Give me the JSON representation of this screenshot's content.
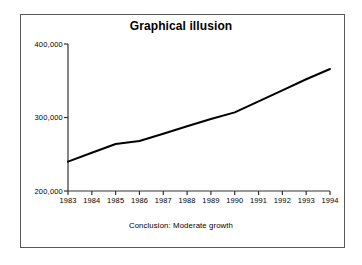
{
  "figure": {
    "border_color": "#595959",
    "background": "#ffffff"
  },
  "chart_data": {
    "type": "line",
    "title": "Graphical illusion",
    "caption": "Conclusion: Moderate growth",
    "xlabel": "",
    "ylabel": "",
    "categories": [
      "1983",
      "1984",
      "1985",
      "1986",
      "1987",
      "1988",
      "1989",
      "1990",
      "1991",
      "1992",
      "1993",
      "1994"
    ],
    "values": [
      240000,
      252000,
      264000,
      268000,
      278000,
      288000,
      298000,
      307000,
      322000,
      337000,
      352000,
      366000
    ],
    "series": [
      {
        "name": "",
        "values": [
          240000,
          252000,
          264000,
          268000,
          278000,
          288000,
          298000,
          307000,
          322000,
          337000,
          352000,
          366000
        ],
        "color": "#000000",
        "line_width": 2
      }
    ],
    "ylim": [
      200000,
      400000
    ],
    "y_ticks": [
      200000,
      300000,
      400000
    ],
    "y_tick_labels": [
      "200,000",
      "300,000",
      "400,000"
    ],
    "x_tick_labels": [
      "1983",
      "1984",
      "1985",
      "1986",
      "1987",
      "1988",
      "1989",
      "1990",
      "1991",
      "1992",
      "1993",
      "1994"
    ],
    "grid": false,
    "legend": false,
    "legend_position": "none",
    "axis_color": "#333333",
    "note": "Truncated y-axis starting at 200,000 exaggerates the slope"
  }
}
